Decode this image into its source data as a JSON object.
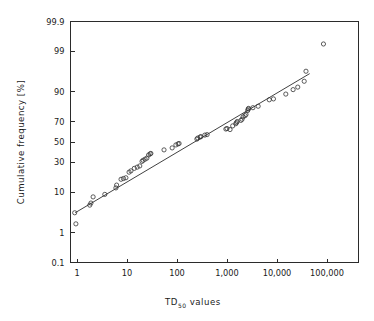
{
  "chart_data": {
    "type": "scatter",
    "title": "",
    "subtitle": "",
    "xlabel": "TD50 values",
    "xlabel_base": "TD",
    "xlabel_sub": "50",
    "xlabel_tail": "values",
    "ylabel": "Cumulative frequency  [%]",
    "x_scale": "log10",
    "y_scale": "probability (probit)",
    "xlim": [
      0.7,
      300000
    ],
    "ylim": [
      0.1,
      99.9
    ],
    "grid": false,
    "legend": null,
    "x_ticks": [
      1,
      10,
      100,
      1000,
      10000,
      100000
    ],
    "x_tick_labels": [
      "1",
      "10",
      "100",
      "1,000",
      "10,000",
      "100,000"
    ],
    "y_ticks": [
      0.1,
      1,
      10,
      30,
      50,
      70,
      90,
      99,
      99.9
    ],
    "y_tick_labels": [
      "0.1",
      "1",
      "10",
      "30",
      "50",
      "70",
      "90",
      "99",
      "99.9"
    ],
    "marker": "open-circle",
    "marker_color": "#333333",
    "line_color": "#2b2b2b",
    "fit_line": {
      "x_start": 0.92,
      "y_start": 3.5,
      "x_end": 45000,
      "y_end": 96.0
    },
    "points": [
      {
        "x": 0.9,
        "y": 3.5
      },
      {
        "x": 0.95,
        "y": 1.8
      },
      {
        "x": 1.8,
        "y": 5.3
      },
      {
        "x": 1.9,
        "y": 5.9
      },
      {
        "x": 2.1,
        "y": 8.0
      },
      {
        "x": 3.6,
        "y": 9.0
      },
      {
        "x": 6.0,
        "y": 12.0
      },
      {
        "x": 6.2,
        "y": 13.5
      },
      {
        "x": 7.6,
        "y": 17.0
      },
      {
        "x": 8.5,
        "y": 17.5
      },
      {
        "x": 9.5,
        "y": 18.0
      },
      {
        "x": 11.0,
        "y": 22.0
      },
      {
        "x": 12.0,
        "y": 23.0
      },
      {
        "x": 14.0,
        "y": 25.0
      },
      {
        "x": 16.0,
        "y": 26.0
      },
      {
        "x": 18.0,
        "y": 27.0
      },
      {
        "x": 20.0,
        "y": 31.0
      },
      {
        "x": 21.0,
        "y": 32.0
      },
      {
        "x": 23.0,
        "y": 33.0
      },
      {
        "x": 25.0,
        "y": 34.0
      },
      {
        "x": 27.0,
        "y": 37.0
      },
      {
        "x": 29.0,
        "y": 38.0
      },
      {
        "x": 30.0,
        "y": 38.5
      },
      {
        "x": 55.0,
        "y": 42.0
      },
      {
        "x": 80.0,
        "y": 44.0
      },
      {
        "x": 95.0,
        "y": 47.0
      },
      {
        "x": 105.0,
        "y": 48.0
      },
      {
        "x": 110.0,
        "y": 48.5
      },
      {
        "x": 250.0,
        "y": 53.0
      },
      {
        "x": 260.0,
        "y": 54.0
      },
      {
        "x": 290.0,
        "y": 55.0
      },
      {
        "x": 300.0,
        "y": 55.5
      },
      {
        "x": 360.0,
        "y": 57.0
      },
      {
        "x": 400.0,
        "y": 57.5
      },
      {
        "x": 950.0,
        "y": 63.0
      },
      {
        "x": 1000.0,
        "y": 63.5
      },
      {
        "x": 1150.0,
        "y": 62.5
      },
      {
        "x": 1300.0,
        "y": 66.0
      },
      {
        "x": 1500.0,
        "y": 68.0
      },
      {
        "x": 1550.0,
        "y": 69.0
      },
      {
        "x": 1600.0,
        "y": 70.0
      },
      {
        "x": 1900.0,
        "y": 71.0
      },
      {
        "x": 2000.0,
        "y": 72.0
      },
      {
        "x": 2100.0,
        "y": 74.0
      },
      {
        "x": 2300.0,
        "y": 75.0
      },
      {
        "x": 2400.0,
        "y": 76.0
      },
      {
        "x": 2600.0,
        "y": 79.0
      },
      {
        "x": 2650.0,
        "y": 80.0
      },
      {
        "x": 2700.0,
        "y": 80.5
      },
      {
        "x": 3300.0,
        "y": 81.0
      },
      {
        "x": 4200.0,
        "y": 82.0
      },
      {
        "x": 7000.0,
        "y": 86.0
      },
      {
        "x": 8500.0,
        "y": 86.5
      },
      {
        "x": 15000.0,
        "y": 89.0
      },
      {
        "x": 21000.0,
        "y": 91.0
      },
      {
        "x": 26000.0,
        "y": 92.0
      },
      {
        "x": 35000.0,
        "y": 94.0
      },
      {
        "x": 38000.0,
        "y": 96.5
      },
      {
        "x": 85000.0,
        "y": 99.4
      }
    ]
  }
}
